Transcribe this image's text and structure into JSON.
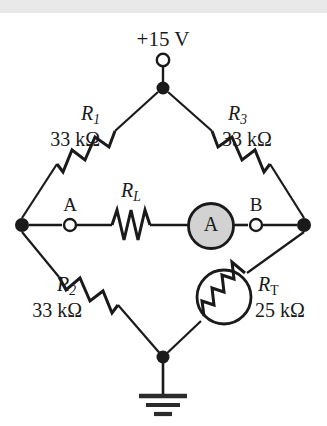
{
  "diagram": {
    "type": "wheatstone-bridge-circuit",
    "supply": {
      "label": "+15 V",
      "terminal": "open-circle-terminal"
    },
    "components": [
      {
        "id": "R1",
        "symbol": "R",
        "subscript": "1",
        "value": "33 kΩ",
        "kind": "resistor",
        "branch": "top-left"
      },
      {
        "id": "R3",
        "symbol": "R",
        "subscript": "3",
        "value": "33 kΩ",
        "kind": "resistor",
        "branch": "top-right"
      },
      {
        "id": "R2",
        "symbol": "R",
        "subscript": "2",
        "value": "33 kΩ",
        "kind": "resistor",
        "branch": "bottom-left"
      },
      {
        "id": "RT",
        "symbol": "R",
        "subscript": "T",
        "value": "25 kΩ",
        "kind": "thermistor",
        "branch": "bottom-right"
      },
      {
        "id": "RL",
        "symbol": "R",
        "subscript": "L",
        "value": "",
        "kind": "resistor",
        "branch": "bridge"
      }
    ],
    "meter": {
      "letter": "A",
      "kind": "ammeter",
      "fill": "#d2d2d2"
    },
    "terminals": [
      {
        "id": "A",
        "label": "A",
        "kind": "open-circle-terminal"
      },
      {
        "id": "B",
        "label": "B",
        "kind": "open-circle-terminal"
      }
    ],
    "ground": {
      "label": "",
      "kind": "earth-ground-symbol",
      "bars": 3
    },
    "colors": {
      "wire": "#1a1a1a",
      "node": "#1a1a1a",
      "meter_fill": "#d2d2d2",
      "background": "#ffffff",
      "top_band": "#e9e9e9"
    }
  }
}
